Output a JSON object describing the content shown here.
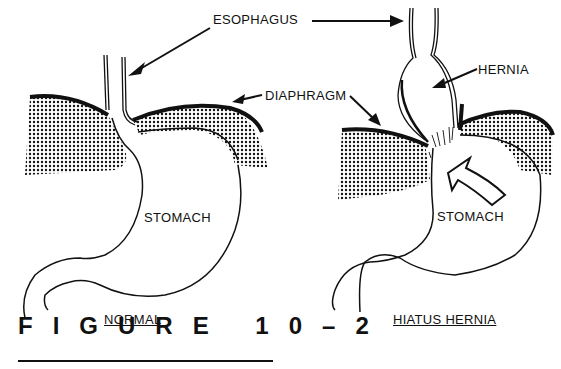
{
  "figure": {
    "caption": "FIGURE 10-2",
    "caption_display": "FIGURE 10–2"
  },
  "labels": {
    "esophagus": "ESOPHAGUS",
    "diaphragm": "DIAPHRAGM",
    "hernia": "HERNIA",
    "stomach_left": "STOMACH",
    "stomach_right": "STOMACH"
  },
  "panels": [
    {
      "id": "normal",
      "title": "NORMAL"
    },
    {
      "id": "hiatus-hernia",
      "title": "HIATUS HERNIA"
    }
  ],
  "colors": {
    "ink": "#111111",
    "background": "#ffffff"
  }
}
